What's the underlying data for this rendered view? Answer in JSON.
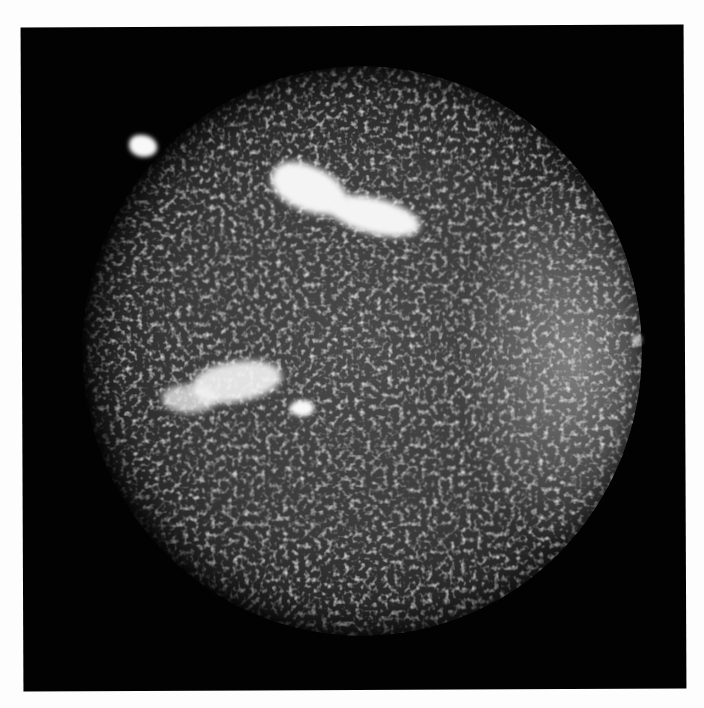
{
  "image": {
    "kind": "grayscale photograph",
    "subject": "solar disk with bright plage regions",
    "colors": {
      "border": "#fdfdfd",
      "frame_background": "#020202",
      "disk_mid": "#3a3a3a",
      "plage": "#f4f4f4"
    },
    "features": [
      {
        "name": "isolated-bright-patch",
        "x": 142,
        "y": 146
      },
      {
        "name": "northern-plage",
        "x": 345,
        "y": 195
      },
      {
        "name": "western-plage",
        "x": 215,
        "y": 375
      },
      {
        "name": "small-plage",
        "x": 300,
        "y": 407
      },
      {
        "name": "limb-brightening-east",
        "x": 570,
        "y": 400
      }
    ]
  }
}
